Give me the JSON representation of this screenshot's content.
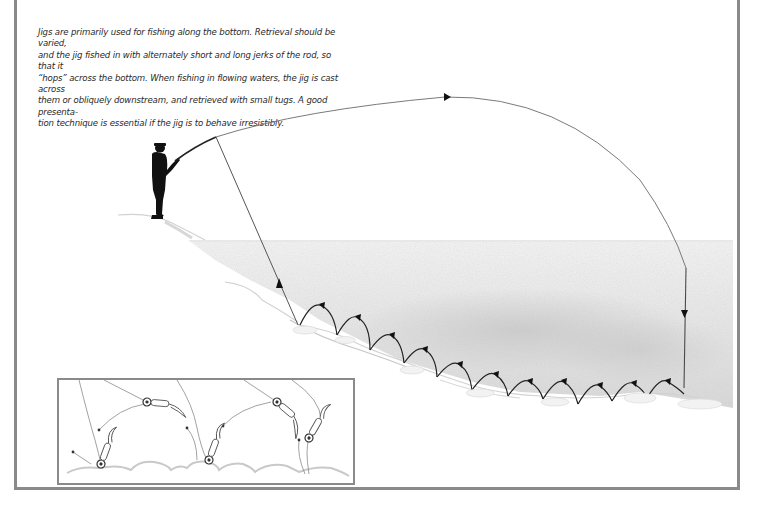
{
  "figure": {
    "caption": "Jigs are primarily used for fishing along the bottom. Retrieval should be varied, and the jig fished in with alternately short and long jerks of the rod, so that it “hops” across the bottom. When fishing in flowing waters, the jig is cast across them or obliquely downstream, and retrieved with small tugs. A good presentation technique is essential if the jig is to behave irresistibly.",
    "caption_lines": [
      "Jigs are primarily used for fishing along the bottom. Retrieval should be varied,",
      "and the jig fished in with alternately short and long jerks of the rod, so that it",
      "“hops” across the bottom. When fishing in flowing waters, the jig is cast across",
      "them or obliquely downstream, and retrieved with small tugs. A good presenta-",
      "tion technique is essential if the jig is to behave irresistibly."
    ],
    "colors": {
      "frame": "#8a8a8a",
      "line": "#4a4a4a",
      "angler": "#111111",
      "water_shade": "#d6d6d6",
      "text": "#2a2a2a"
    }
  },
  "illustration": {
    "angler": "silhouette-of-angler-with-rod",
    "cast_arc": "line-cast-arc-with-direction-arrows",
    "hops_count": 12,
    "inset": "jig-hopping-detail-closeup",
    "inset_jigs_count": 6
  }
}
